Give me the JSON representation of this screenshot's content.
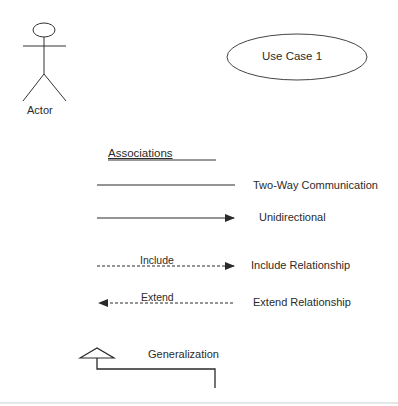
{
  "diagram": {
    "type": "UML use case notation legend",
    "actor": {
      "label": "Actor"
    },
    "use_case": {
      "label": "Use Case 1"
    },
    "associations": {
      "heading": "Associations",
      "items": [
        {
          "line_label": "",
          "description": "Two-Way Communication",
          "style": "solid",
          "arrow": "none"
        },
        {
          "line_label": "",
          "description": "Unidirectional",
          "style": "solid",
          "arrow": "right"
        },
        {
          "line_label": "Include",
          "description": "Include Relationship",
          "style": "dashed",
          "arrow": "right"
        },
        {
          "line_label": "Extend",
          "description": "Extend Relationship",
          "style": "dashed",
          "arrow": "left"
        }
      ]
    },
    "generalization": {
      "label": "Generalization",
      "arrow": "hollow-triangle"
    },
    "colors": {
      "line": "#2a2a2a",
      "background": "#ffffff"
    }
  }
}
